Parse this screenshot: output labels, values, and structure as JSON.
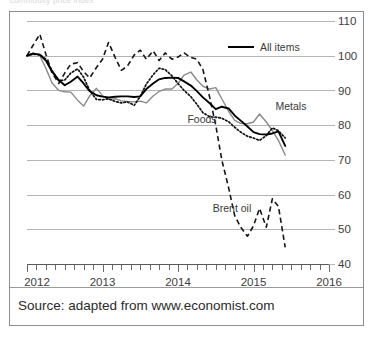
{
  "figure": {
    "top_remnant_text": "commodity price index",
    "source_note": "Source: adapted from www.economist.com"
  },
  "legend": {
    "items": [
      {
        "label": "All items",
        "style": "solid",
        "color": "#000000"
      }
    ]
  },
  "annotations": [
    {
      "name": "metals-label",
      "text": "Metals",
      "x": 291,
      "y": 110
    },
    {
      "name": "foods-label",
      "text": "Foods",
      "x": 202,
      "y": 123
    },
    {
      "name": "brent-oil-label",
      "text": "Brent oil",
      "x": 232,
      "y": 212
    }
  ],
  "axes": {
    "y_ticks": [
      "110",
      "100",
      "90",
      "80",
      "70",
      "60",
      "50",
      "40"
    ],
    "x_ticks": [
      "2012",
      "2013",
      "2014",
      "2015",
      "2016"
    ]
  },
  "chart_data": {
    "type": "line",
    "title": "",
    "subtitle": "",
    "xlabel": "",
    "ylabel": "",
    "xlim": [
      2012.0,
      2016.0
    ],
    "ylim": [
      40,
      110
    ],
    "yticks": [
      40,
      50,
      60,
      70,
      80,
      90,
      100,
      110
    ],
    "xticks": [
      2012,
      2013,
      2014,
      2015,
      2016
    ],
    "x_minor_tick_interval": 0.125,
    "grid": "horizontal",
    "legend_position": "top-right",
    "note": "Index, 2012 = 100. Monthly values approximated from the plotted curves.",
    "series": [
      {
        "name": "All items",
        "style": "solid",
        "color": "#000000",
        "x": [
          2012.0,
          2012.08,
          2012.17,
          2012.25,
          2012.33,
          2012.42,
          2012.5,
          2012.58,
          2012.67,
          2012.75,
          2012.83,
          2012.92,
          2013.0,
          2013.08,
          2013.17,
          2013.25,
          2013.33,
          2013.42,
          2013.5,
          2013.58,
          2013.67,
          2013.75,
          2013.83,
          2013.92,
          2014.0,
          2014.08,
          2014.17,
          2014.25,
          2014.33,
          2014.42,
          2014.5,
          2014.58,
          2014.67,
          2014.75,
          2014.83,
          2014.92,
          2015.0,
          2015.08,
          2015.17,
          2015.25,
          2015.33,
          2015.42
        ],
        "y": [
          100.0,
          100.6,
          100.3,
          98.6,
          95.5,
          93.0,
          91.5,
          92.5,
          94.0,
          92.0,
          89.8,
          88.6,
          88.2,
          88.0,
          88.2,
          88.3,
          88.3,
          88.1,
          88.3,
          90.4,
          92.0,
          93.2,
          93.6,
          93.7,
          93.6,
          92.6,
          91.4,
          89.8,
          88.0,
          86.3,
          84.6,
          85.3,
          84.8,
          82.8,
          81.3,
          79.6,
          78.0,
          77.4,
          77.3,
          77.6,
          78.2,
          74.0
        ]
      },
      {
        "name": "Metals",
        "style": "solid",
        "color": "#8a8a8a",
        "x": [
          2012.0,
          2012.08,
          2012.17,
          2012.25,
          2012.33,
          2012.42,
          2012.5,
          2012.58,
          2012.67,
          2012.75,
          2012.83,
          2012.92,
          2013.0,
          2013.08,
          2013.17,
          2013.25,
          2013.33,
          2013.42,
          2013.5,
          2013.58,
          2013.67,
          2013.75,
          2013.83,
          2013.92,
          2014.0,
          2014.08,
          2014.17,
          2014.25,
          2014.33,
          2014.42,
          2014.5,
          2014.58,
          2014.67,
          2014.75,
          2014.83,
          2014.92,
          2015.0,
          2015.08,
          2015.17,
          2015.25,
          2015.33,
          2015.42
        ],
        "y": [
          100.0,
          100.8,
          100.0,
          96.4,
          92.2,
          90.0,
          89.6,
          89.5,
          87.2,
          85.5,
          88.4,
          90.6,
          88.5,
          87.4,
          87.6,
          87.0,
          86.8,
          86.7,
          86.9,
          86.4,
          88.4,
          89.7,
          90.4,
          90.4,
          92.0,
          94.4,
          95.3,
          93.0,
          91.2,
          90.4,
          90.8,
          87.6,
          84.0,
          81.4,
          80.5,
          80.4,
          80.9,
          83.2,
          80.9,
          78.4,
          75.6,
          71.4
        ]
      },
      {
        "name": "Foods",
        "style": "dotted",
        "color": "#111111",
        "x": [
          2012.0,
          2012.08,
          2012.17,
          2012.25,
          2012.33,
          2012.42,
          2012.5,
          2012.58,
          2012.67,
          2012.75,
          2012.83,
          2012.92,
          2013.0,
          2013.08,
          2013.17,
          2013.25,
          2013.33,
          2013.42,
          2013.5,
          2013.58,
          2013.67,
          2013.75,
          2013.83,
          2013.92,
          2014.0,
          2014.08,
          2014.17,
          2014.25,
          2014.33,
          2014.42,
          2014.5,
          2014.58,
          2014.67,
          2014.75,
          2014.83,
          2014.92,
          2015.0,
          2015.08,
          2015.17,
          2015.25,
          2015.33,
          2015.42
        ],
        "y": [
          100.0,
          100.4,
          100.3,
          99.0,
          95.8,
          92.8,
          93.0,
          95.0,
          96.2,
          93.8,
          90.0,
          87.4,
          87.3,
          87.6,
          86.8,
          86.4,
          86.7,
          85.7,
          88.3,
          91.8,
          94.5,
          96.4,
          96.0,
          94.2,
          92.0,
          90.0,
          88.2,
          86.0,
          83.6,
          82.4,
          82.3,
          82.0,
          81.0,
          79.4,
          78.0,
          76.8,
          76.3,
          75.6,
          77.0,
          79.2,
          78.4,
          76.3
        ]
      },
      {
        "name": "Brent oil",
        "style": "dashed",
        "color": "#161616",
        "x": [
          2012.0,
          2012.08,
          2012.17,
          2012.25,
          2012.33,
          2012.42,
          2012.5,
          2012.58,
          2012.67,
          2012.75,
          2012.83,
          2012.92,
          2013.0,
          2013.08,
          2013.17,
          2013.25,
          2013.33,
          2013.42,
          2013.5,
          2013.58,
          2013.67,
          2013.75,
          2013.83,
          2013.92,
          2014.0,
          2014.08,
          2014.17,
          2014.25,
          2014.33,
          2014.42,
          2014.5,
          2014.58,
          2014.67,
          2014.75,
          2014.83,
          2014.92,
          2015.0,
          2015.08,
          2015.17,
          2015.25,
          2015.33,
          2015.42
        ],
        "y": [
          100.0,
          103.0,
          106.2,
          100.4,
          95.2,
          92.0,
          95.0,
          97.6,
          98.0,
          95.4,
          93.6,
          96.6,
          99.0,
          103.8,
          99.4,
          95.8,
          97.0,
          100.2,
          101.6,
          99.0,
          101.4,
          98.6,
          100.8,
          99.0,
          99.6,
          100.8,
          99.5,
          99.0,
          96.0,
          88.0,
          80.0,
          70.0,
          62.0,
          54.0,
          50.6,
          48.0,
          51.0,
          56.0,
          50.6,
          58.8,
          56.6,
          44.8
        ]
      }
    ]
  }
}
